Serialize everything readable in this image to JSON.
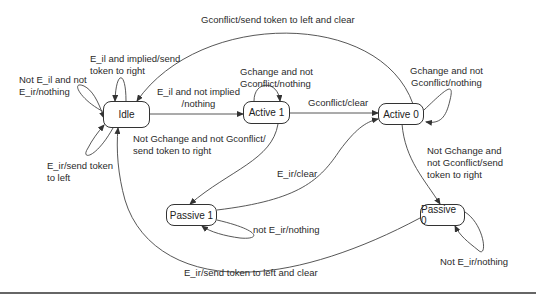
{
  "diagram": {
    "type": "state-machine",
    "states": [
      {
        "id": "idle",
        "label": "Idle"
      },
      {
        "id": "active1",
        "label": "Active 1"
      },
      {
        "id": "active0",
        "label": "Active 0"
      },
      {
        "id": "passive1",
        "label": "Passive 1"
      },
      {
        "id": "passive0",
        "label": "Passive 0"
      }
    ],
    "transitions": [
      {
        "from": "idle",
        "to": "idle",
        "label": "Not E_il and not\nE_ir/nothing"
      },
      {
        "from": "idle",
        "to": "idle",
        "label": "E_il and implied/send\ntoken to right"
      },
      {
        "from": "idle",
        "to": "idle",
        "label": "E_ir/send token\nto left"
      },
      {
        "from": "idle",
        "to": "active1",
        "label": "E_il and not implied\n/nothing"
      },
      {
        "from": "active0",
        "to": "idle",
        "label": "Gconflict/send token to left and clear"
      },
      {
        "from": "active1",
        "to": "active1",
        "label": "Gchange and not\nGconflict/nothing"
      },
      {
        "from": "active1",
        "to": "active0",
        "label": "Gconflict/clear"
      },
      {
        "from": "active1",
        "to": "passive1",
        "label": "Not Gchange and not Gconflict/\nsend token to right"
      },
      {
        "from": "active0",
        "to": "active0",
        "label": "Gchange and not\nGconflict/nothing"
      },
      {
        "from": "active0",
        "to": "passive0",
        "label": "Not Gchange and\nnot Gconflict/send\ntoken to right"
      },
      {
        "from": "passive1",
        "to": "active0",
        "label": "E_ir/clear"
      },
      {
        "from": "passive1",
        "to": "passive1",
        "label": "not E_ir/nothing"
      },
      {
        "from": "passive0",
        "to": "passive0",
        "label": "Not E_ir/nothing"
      },
      {
        "from": "passive0",
        "to": "idle",
        "label": "E_ir/send token to left and clear"
      }
    ]
  }
}
